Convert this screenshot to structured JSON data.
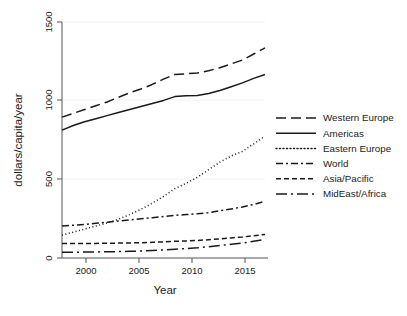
{
  "chart_data": {
    "type": "line",
    "title": "",
    "xlabel": "Year",
    "ylabel": "dollars/capita/year",
    "xlim": [
      1998,
      2016
    ],
    "ylim": [
      0,
      1550
    ],
    "xticks": [
      2000,
      2005,
      2010,
      2015
    ],
    "yticks": [
      0,
      500,
      1000,
      1500
    ],
    "xtick_labels": [
      "2000",
      "2005",
      "2010",
      "2015"
    ],
    "ytick_labels": [
      "0",
      "500",
      "1000",
      "1500"
    ],
    "grid": false,
    "legend_position": "right",
    "x": [
      1998,
      1999,
      2000,
      2001,
      2002,
      2003,
      2004,
      2005,
      2006,
      2007,
      2008,
      2009,
      2010,
      2011,
      2012,
      2013,
      2014,
      2015,
      2016
    ],
    "series": [
      {
        "name": "Western Europe",
        "dash": "long-dash",
        "values": [
          925,
          950,
          975,
          1000,
          1025,
          1055,
          1085,
          1110,
          1140,
          1175,
          1205,
          1210,
          1215,
          1230,
          1250,
          1275,
          1300,
          1340,
          1380
        ]
      },
      {
        "name": "Americas",
        "dash": "solid",
        "values": [
          840,
          870,
          895,
          915,
          935,
          955,
          975,
          995,
          1015,
          1035,
          1060,
          1065,
          1068,
          1080,
          1100,
          1125,
          1150,
          1180,
          1205
        ]
      },
      {
        "name": "Eastern Europe",
        "dash": "dotted",
        "values": [
          150,
          170,
          190,
          210,
          230,
          255,
          285,
          320,
          360,
          405,
          455,
          490,
          530,
          580,
          630,
          670,
          700,
          750,
          800
        ]
      },
      {
        "name": "World",
        "dash": "dash-dot",
        "values": [
          210,
          215,
          220,
          228,
          235,
          243,
          250,
          258,
          265,
          272,
          280,
          285,
          290,
          298,
          310,
          322,
          335,
          352,
          372
        ]
      },
      {
        "name": "Asia/Pacific",
        "dash": "medium-dash",
        "values": [
          95,
          95,
          96,
          96,
          97,
          98,
          99,
          100,
          103,
          106,
          110,
          112,
          115,
          120,
          126,
          132,
          138,
          146,
          155
        ]
      },
      {
        "name": "MidEast/Africa",
        "dash": "long-dash-dot",
        "values": [
          38,
          38,
          39,
          40,
          41,
          42,
          44,
          46,
          49,
          53,
          58,
          62,
          67,
          74,
          82,
          90,
          98,
          110,
          122
        ]
      }
    ]
  },
  "legend": {
    "items": [
      {
        "label": "Western Europe",
        "dash": "10,5"
      },
      {
        "label": "Americas",
        "dash": "none"
      },
      {
        "label": "Eastern Europe",
        "dash": "1,2.5"
      },
      {
        "label": "World",
        "dash": "7,3,2,3"
      },
      {
        "label": "Asia/Pacific",
        "dash": "5,3"
      },
      {
        "label": "MidEast/Africa",
        "dash": "11,4,2,4"
      }
    ]
  },
  "colors": {
    "line": "#1a1a1a",
    "axis": "#555555",
    "background": "#ffffff",
    "text": "#222222"
  }
}
